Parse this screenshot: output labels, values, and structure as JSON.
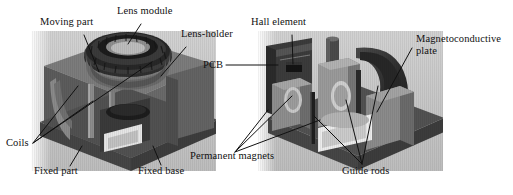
{
  "figure": {
    "kind": "technical-illustration",
    "background_color": "#ffffff",
    "ink_color": "#111111",
    "panel_count": 2
  },
  "panels": [
    {
      "id": "left-panel",
      "name": "assembled-actuator-view",
      "bounds": {
        "x": 31,
        "y": 31,
        "width": 185,
        "height": 140
      },
      "tint": "#b9b9b9"
    },
    {
      "id": "right-panel",
      "name": "cutaway-actuator-view",
      "bounds": {
        "x": 258,
        "y": 31,
        "width": 185,
        "height": 140
      },
      "tint": "#b9b9b9"
    }
  ],
  "labels": [
    {
      "id": "moving-part",
      "text": "Moving part",
      "panel": "left-panel",
      "x": 40,
      "y": 22,
      "leader": {
        "x1": 84,
        "y1": 35,
        "x2": 99,
        "y2": 72
      }
    },
    {
      "id": "lens-module",
      "text": "Lens module",
      "panel": "left-panel",
      "x": 117,
      "y": 11,
      "leader": {
        "x1": 141,
        "y1": 24,
        "x2": 128,
        "y2": 44
      }
    },
    {
      "id": "lens-holder",
      "text": "Lens-holder",
      "panel": "left-panel",
      "x": 181,
      "y": 34,
      "leader": {
        "x1": 186,
        "y1": 47,
        "x2": 161,
        "y2": 76
      }
    },
    {
      "id": "pcb",
      "text": "PCB",
      "panel": "right-panel",
      "x": 203,
      "y": 60,
      "leader": {
        "x1": 226,
        "y1": 65,
        "x2": 276,
        "y2": 65
      }
    },
    {
      "id": "hall-element",
      "text": "Hall element",
      "panel": "right-panel",
      "x": 251,
      "y": 22,
      "leader": {
        "x1": 292,
        "y1": 35,
        "x2": 293,
        "y2": 63
      }
    },
    {
      "id": "magnetoconductive-plate",
      "text": "Magnetoconductive plate",
      "panel": "right-panel",
      "x": 416,
      "y": 38,
      "two_line": true,
      "leader": {
        "x1": 412,
        "y1": 48,
        "x2": 377,
        "y2": 110
      }
    },
    {
      "id": "coils",
      "text": "Coils",
      "panel": "left-panel",
      "x": 7,
      "y": 140,
      "leaders": [
        {
          "x1": 32,
          "y1": 143,
          "x2": 75,
          "y2": 88
        },
        {
          "x1": 32,
          "y1": 143,
          "x2": 90,
          "y2": 100
        },
        {
          "x1": 32,
          "y1": 143,
          "x2": 150,
          "y2": 64
        }
      ]
    },
    {
      "id": "fixed-part",
      "text": "Fixed part",
      "panel": "left-panel",
      "x": 34,
      "y": 168,
      "leader": {
        "x1": 70,
        "y1": 167,
        "x2": 81,
        "y2": 148
      }
    },
    {
      "id": "fixed-base",
      "text": "Fixed base",
      "panel": "left-panel",
      "x": 138,
      "y": 168,
      "leader": {
        "x1": 160,
        "y1": 166,
        "x2": 152,
        "y2": 147
      }
    },
    {
      "id": "permanent-magnets",
      "text": "Permanent magnets",
      "panel": "right-panel",
      "x": 190,
      "y": 155,
      "leaders": [
        {
          "x1": 234,
          "y1": 154,
          "x2": 266,
          "y2": 112
        },
        {
          "x1": 234,
          "y1": 154,
          "x2": 290,
          "y2": 97
        },
        {
          "x1": 234,
          "y1": 154,
          "x2": 318,
          "y2": 120
        }
      ]
    },
    {
      "id": "guide-rods",
      "text": "Guide rods",
      "panel": "right-panel",
      "x": 342,
      "y": 168,
      "leaders": [
        {
          "x1": 362,
          "y1": 166,
          "x2": 316,
          "y2": 118
        },
        {
          "x1": 362,
          "y1": 166,
          "x2": 347,
          "y2": 103
        },
        {
          "x1": 362,
          "y1": 166,
          "x2": 375,
          "y2": 88
        }
      ]
    }
  ],
  "palette": {
    "paper": "#ffffff",
    "ink": "#111111",
    "render_backdrop": "#c4c4c4",
    "body_dark": "#565656",
    "body_mid": "#6f6f6f",
    "body_light": "#949494",
    "body_lightest": "#b0b0b0",
    "magnet_dark": "#3a3a3a",
    "magnet_black": "#242424",
    "highlight": "#e8e8e8",
    "shadow": "#3f3f3f"
  }
}
